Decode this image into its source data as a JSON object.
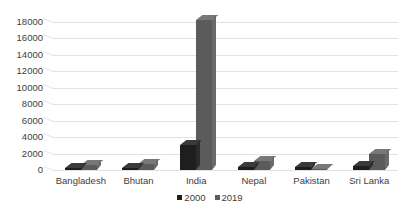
{
  "chart_data": {
    "type": "bar",
    "title": "",
    "subtitle": "",
    "xlabel": "",
    "ylabel": "",
    "categories": [
      "Bangladesh",
      "Bhutan",
      "India",
      "Nepal",
      "Pakistan",
      "Sri Lanka"
    ],
    "series": [
      {
        "name": "2000",
        "color": "#1e1e1e",
        "values": [
          300,
          260,
          3100,
          420,
          330,
          500
        ]
      },
      {
        "name": "2019",
        "color": "#5b5b5b",
        "values": [
          600,
          700,
          18300,
          1100,
          120,
          2000
        ]
      }
    ],
    "ylim": [
      0,
      18000
    ],
    "ytick_labels": [
      "18000",
      "16000",
      "14000",
      "12000",
      "10000",
      "8000",
      "6000",
      "4000",
      "2000",
      "0"
    ],
    "ytick_values": [
      18000,
      16000,
      14000,
      12000,
      10000,
      8000,
      6000,
      4000,
      2000,
      0
    ],
    "grid": true,
    "legend_position": "bottom",
    "legend_entries": [
      "2000",
      "2019"
    ],
    "style": "3d-clustered-column",
    "background_color": "#ffffff",
    "gridline_color": "#e2e2e2",
    "text_color": "#404040"
  }
}
